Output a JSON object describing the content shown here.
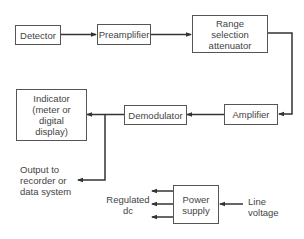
{
  "diagram": {
    "type": "block-diagram",
    "blocks": {
      "detector": "Detector",
      "preamplifier": "Preamplifier",
      "range_selection": "Range selection attenuator",
      "amplifier": "Amplifier",
      "demodulator": "Demodulator",
      "indicator": "Indicator (meter or digital display)",
      "power_supply": "Power supply"
    },
    "labels": {
      "output": "Output to recorder or data system",
      "regulated_dc": "Regulated dc",
      "line_voltage": "Line voltage"
    },
    "connections": [
      {
        "from": "Detector",
        "to": "Preamplifier"
      },
      {
        "from": "Preamplifier",
        "to": "Range selection attenuator"
      },
      {
        "from": "Range selection attenuator",
        "to": "Amplifier"
      },
      {
        "from": "Amplifier",
        "to": "Demodulator"
      },
      {
        "from": "Demodulator",
        "to": "Indicator (meter or digital display)"
      },
      {
        "from": "Demodulator",
        "to": "Output to recorder or data system"
      },
      {
        "from": "Line voltage",
        "to": "Power supply"
      },
      {
        "from": "Power supply",
        "to": "Regulated dc"
      }
    ]
  }
}
